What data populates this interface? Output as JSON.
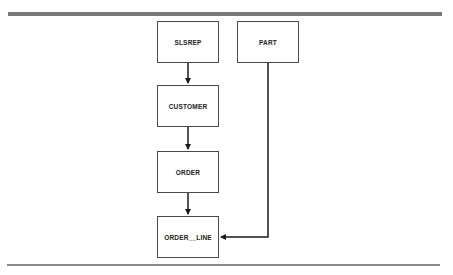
{
  "diagram": {
    "entities": [
      {
        "id": "slsrep",
        "label": "SLSREP"
      },
      {
        "id": "part",
        "label": "PART"
      },
      {
        "id": "customer",
        "label": "CUSTOMER"
      },
      {
        "id": "order",
        "label": "ORDER"
      },
      {
        "id": "order_line",
        "label": "ORDER__LINE"
      }
    ],
    "relationships": [
      {
        "from": "SLSREP",
        "to": "CUSTOMER"
      },
      {
        "from": "CUSTOMER",
        "to": "ORDER"
      },
      {
        "from": "ORDER",
        "to": "ORDER__LINE"
      },
      {
        "from": "PART",
        "to": "ORDER__LINE"
      }
    ],
    "colors": {
      "line": "#1a1a1a",
      "rule": "#7a7a7a",
      "box_border": "#4a4a4a"
    }
  }
}
